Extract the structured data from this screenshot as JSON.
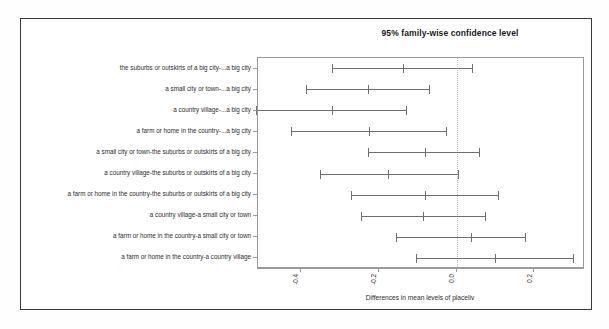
{
  "chart_data": {
    "type": "line",
    "title": "95% family-wise confidence level",
    "xlabel": "Differences in mean levels of placeliv",
    "ylabel": "",
    "xlim": [
      -0.51,
      0.33
    ],
    "xticks": [
      -0.4,
      -0.2,
      0.0,
      0.2
    ],
    "xticklabels": [
      "-0.4",
      "-0.2",
      "0.0",
      "0.2"
    ],
    "grid": false,
    "reference_line": 0.0,
    "reference_line_style": "dotted",
    "orientation": "horizontal",
    "categories": [
      "the suburbs or outskirts of a big city-...a big city",
      "a small city or town-...a big city",
      "a country village-...a big city",
      "a farm or home in the country-...a big city",
      "a small city or town-the suburbs or outskirts of a big city",
      "a country village-the suburbs or outskirts of a big city",
      "a farm or home in the country-the suburbs or outskirts of a big city",
      "a country village-a small city or town",
      "a farm or home in the country-a small city or town",
      "a farm or home in the country-a country village"
    ],
    "intervals": [
      {
        "label": "the suburbs or outskirts of a big city-...a big city",
        "lower": -0.32,
        "center": -0.138,
        "upper": 0.04
      },
      {
        "label": "a small city or town-...a big city",
        "lower": -0.387,
        "center": -0.228,
        "upper": -0.072
      },
      {
        "label": "a country village-...a big city",
        "lower": -0.514,
        "center": -0.32,
        "upper": -0.13
      },
      {
        "label": "a farm or home in the country-...a big city",
        "lower": -0.424,
        "center": -0.225,
        "upper": -0.026
      },
      {
        "label": "a small city or town-the suburbs or outskirts of a big city",
        "lower": -0.228,
        "center": -0.082,
        "upper": 0.058
      },
      {
        "label": "a country village-the suburbs or outskirts of a big city",
        "lower": -0.352,
        "center": -0.175,
        "upper": 0.005
      },
      {
        "label": "a farm or home in the country-the suburbs or outskirts of a big city",
        "lower": -0.27,
        "center": -0.082,
        "upper": 0.106
      },
      {
        "label": "a country village-a small city or town",
        "lower": -0.246,
        "center": -0.085,
        "upper": 0.074
      },
      {
        "label": "a farm or home in the country-a small city or town",
        "lower": -0.156,
        "center": 0.037,
        "upper": 0.175
      },
      {
        "label": "a farm or home in the country-a country village",
        "lower": -0.103,
        "center": 0.098,
        "upper": 0.299
      }
    ]
  }
}
